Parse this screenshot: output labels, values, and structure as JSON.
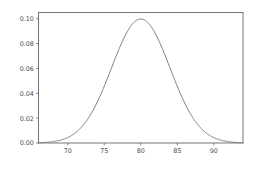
{
  "chart_data": {
    "type": "line",
    "title": "",
    "subtitle": "",
    "xlabel": "",
    "ylabel": "",
    "xlim": [
      66.0,
      94.0
    ],
    "ylim": [
      0.0,
      0.105
    ],
    "grid": false,
    "legend": null,
    "annotations": [],
    "curve_colors": {
      "line": "#6e6e6e",
      "frame": "#666666",
      "text": "#4d4d4d",
      "background": "#ffffff"
    },
    "xticks": [
      70,
      75,
      80,
      85,
      90
    ],
    "xtick_labels": [
      "70",
      "75",
      "80",
      "85",
      "90"
    ],
    "yticks": [
      0.0,
      0.02,
      0.04,
      0.06,
      0.08,
      0.1
    ],
    "ytick_labels": [
      "0.00",
      "0.02",
      "0.04",
      "0.06",
      "0.08",
      "0.10"
    ],
    "series": [
      {
        "name": "normal density",
        "distribution": "normal",
        "mean": 80,
        "sigma": 4,
        "peak_value": 0.0997,
        "x": [
          66,
          67,
          68,
          69,
          70,
          71,
          72,
          73,
          74,
          75,
          76,
          77,
          78,
          79,
          80,
          81,
          82,
          83,
          84,
          85,
          86,
          87,
          88,
          89,
          90,
          91,
          92,
          93,
          94
        ],
        "values": [
          0.0005,
          0.0009,
          0.0018,
          0.0032,
          0.0054,
          0.0086,
          0.013,
          0.0187,
          0.0258,
          0.0342,
          0.0435,
          0.053,
          0.0621,
          0.0698,
          0.0755,
          0.0785,
          0.0785,
          0.0755,
          0.0698,
          0.0621,
          0.053,
          0.0435,
          0.0342,
          0.0258,
          0.0187,
          0.013,
          0.0086,
          0.0054,
          0.0032
        ]
      }
    ]
  },
  "figure": {
    "width": 255,
    "height": 172
  }
}
